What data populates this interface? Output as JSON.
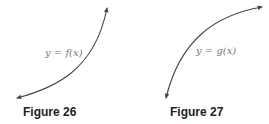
{
  "figures": [
    {
      "id": "26",
      "caption": "Figure 26",
      "curve_label": "y = f(x)",
      "curve_shape": "increasing, concave up (exponential-like), arrows at both ends",
      "color": "#444444"
    },
    {
      "id": "27",
      "caption": "Figure 27",
      "curve_label": "y = g(x)",
      "curve_shape": "increasing, concave down (logarithmic-like), arrows at both ends",
      "color": "#444444"
    }
  ]
}
